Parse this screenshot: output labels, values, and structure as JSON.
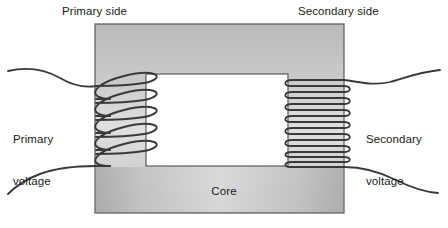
{
  "figure": {
    "background_color": "#ffffff"
  },
  "labels": {
    "primary_side": "Primary side",
    "secondary_side": "Secondary side",
    "primary_voltage_line1": "Primary",
    "primary_voltage_line2": "voltage",
    "secondary_voltage_line1": "Secondary",
    "secondary_voltage_line2": "voltage",
    "core": "Core"
  },
  "colors": {
    "core_fill_dark": "#b4b4b4",
    "core_fill_light": "#e2e2e2",
    "core_stroke": "#5a5a5a",
    "window_fill": "#ffffff",
    "wire_stroke": "#3a3a3a",
    "text": "#1a1a1a"
  },
  "geometry": {
    "core_outer": {
      "x": 95,
      "y": 24,
      "width": 249,
      "height": 189
    },
    "core_window": {
      "x": 146,
      "y": 74,
      "width": 142,
      "height": 92
    },
    "primary_limb": {
      "x": 95,
      "y": 24,
      "width": 51,
      "height": 189
    },
    "secondary_limb": {
      "x": 288,
      "y": 24,
      "width": 56,
      "height": 189
    }
  },
  "windings": {
    "primary": {
      "name": "primary-winding",
      "turns": 5,
      "style": "loose elliptical loops",
      "top_y": 78,
      "bottom_y": 162,
      "lead_top": "wavy lead exiting left at top",
      "lead_bottom": "wavy lead exiting left at bottom"
    },
    "secondary": {
      "name": "secondary-winding",
      "turns": 8,
      "style": "tight flat loops",
      "top_y": 80,
      "bottom_y": 160,
      "lead_top": "wavy lead exiting right at top",
      "lead_bottom": "wavy lead exiting right at bottom"
    }
  }
}
